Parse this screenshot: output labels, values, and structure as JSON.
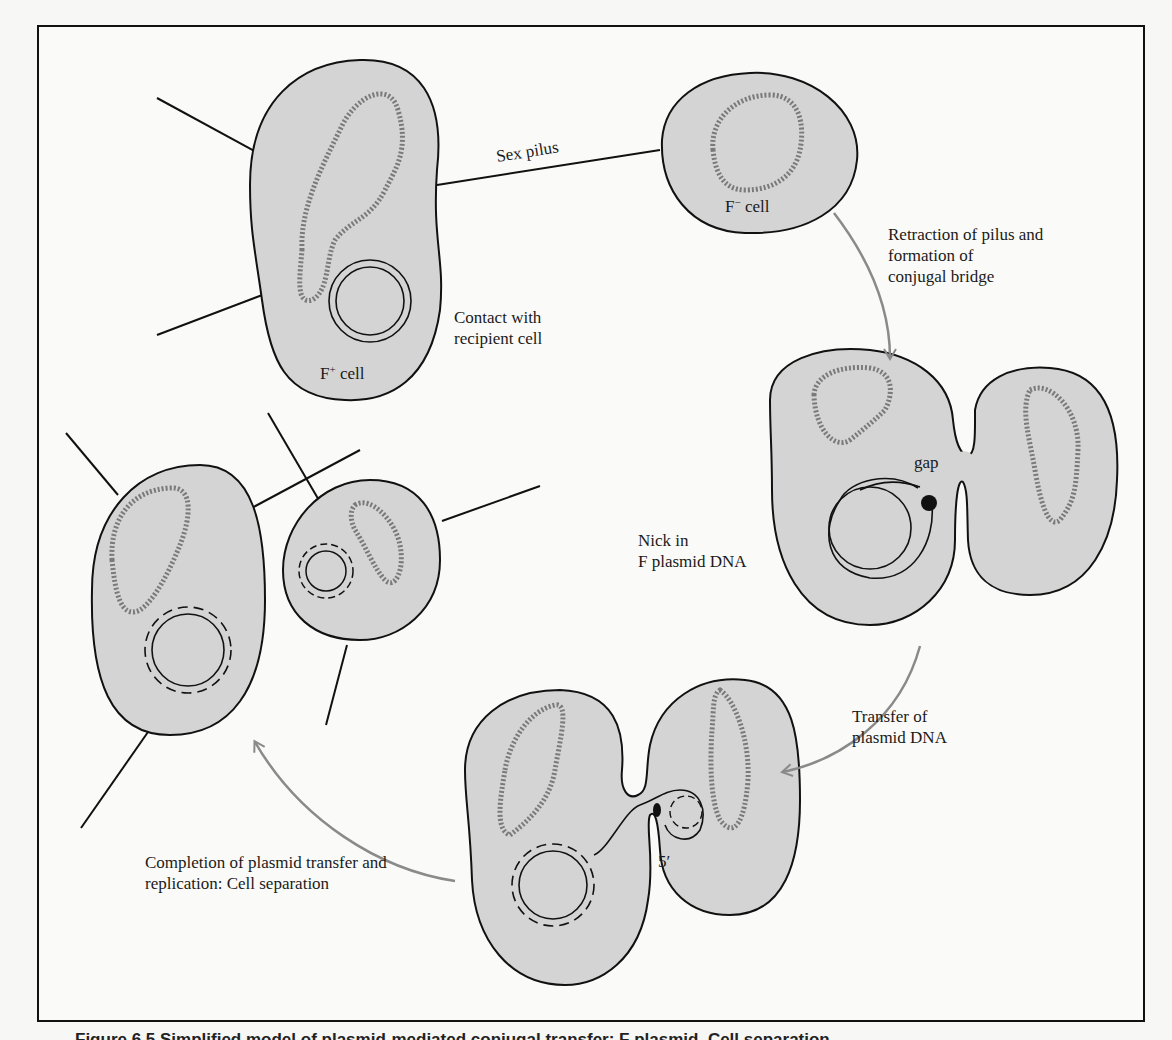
{
  "figure": {
    "caption": "Figure 6.5  Simplified model of plasmid-mediated conjugal transfer: F plasmid. Cell separation.",
    "colors": {
      "cell_fill": "#d4d4d4",
      "outline": "#111111",
      "chromosome": "#777777",
      "arrow": "#8a8a8a",
      "background": "#fafaf8"
    }
  },
  "labels": {
    "sex_pilus": "Sex pilus",
    "f_minus_cell": {
      "base": "F",
      "sup": "−",
      "rest": " cell"
    },
    "f_plus_cell": {
      "base": "F",
      "sup": "+",
      "rest": " cell"
    },
    "contact": [
      "Contact with",
      "recipient cell"
    ],
    "retraction": [
      "Retraction of pilus and",
      "formation of",
      "conjugal bridge"
    ],
    "gap": "gap",
    "nick": [
      "Nick in",
      "F plasmid DNA"
    ],
    "transfer": [
      "Transfer of",
      "plasmid DNA"
    ],
    "five_prime": "5′",
    "completion": [
      "Completion of plasmid transfer and",
      "replication:  Cell separation"
    ]
  },
  "stages": [
    {
      "id": 1,
      "name": "Contact with recipient cell"
    },
    {
      "id": 2,
      "name": "Retraction of pilus and formation of conjugal bridge"
    },
    {
      "id": 3,
      "name": "Nick in F plasmid DNA"
    },
    {
      "id": 4,
      "name": "Transfer of plasmid DNA"
    },
    {
      "id": 5,
      "name": "Completion of plasmid transfer and replication: Cell separation"
    }
  ]
}
